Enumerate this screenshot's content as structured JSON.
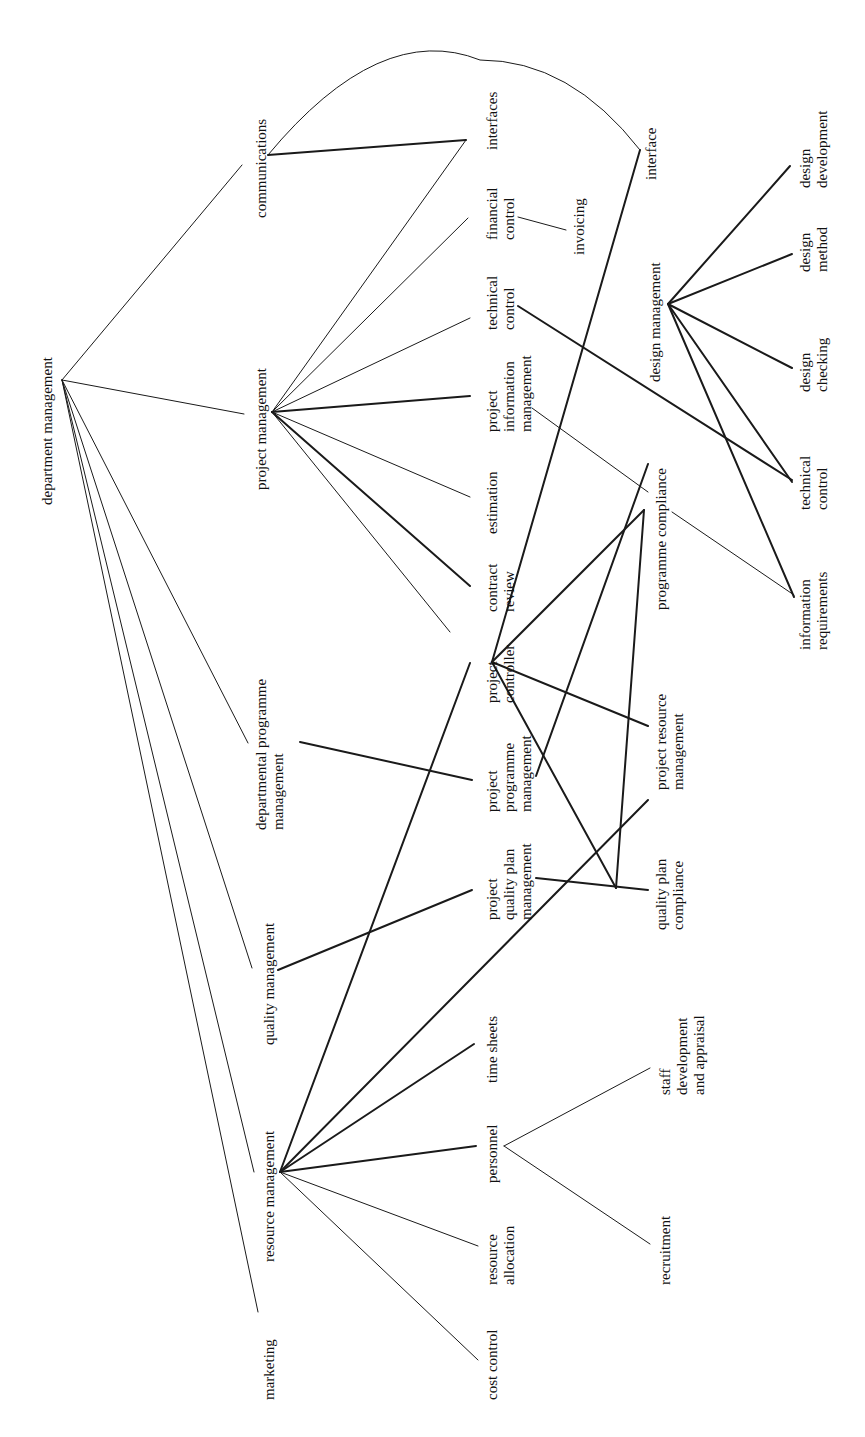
{
  "diagram": {
    "orientation": "rotated-90-ccw",
    "nodes": {
      "department_management": "department management",
      "marketing": "marketing",
      "resource_management": "resource management",
      "quality_management": "quality management",
      "departmental_programme_management": [
        "departmental programme",
        "management"
      ],
      "project_management": "project management",
      "communications": "communications",
      "cost_control": "cost control",
      "resource_allocation": [
        "resource",
        "allocation"
      ],
      "personnel": "personnel",
      "time_sheets": "time sheets",
      "project_quality_plan_management": [
        "project",
        "quality plan",
        "management"
      ],
      "project_programme_management": [
        "project",
        "programme",
        "management"
      ],
      "project_controller": [
        "project",
        "controller"
      ],
      "contract_review": [
        "contract",
        "review"
      ],
      "estimation": "estimation",
      "project_information_management": [
        "project",
        "information",
        "management"
      ],
      "technical_control_pm": [
        "technical",
        "control"
      ],
      "financial_control": [
        "financial",
        "control"
      ],
      "interfaces": "interfaces",
      "recruitment": "recruitment",
      "staff_development_and_appraisal": [
        "staff",
        "development",
        "and appraisal"
      ],
      "quality_plan_compliance": [
        "quality plan",
        "compliance"
      ],
      "project_resource_management": [
        "project resource",
        "management"
      ],
      "programme_compliance": "programme compliance",
      "invoicing": "invoicing",
      "interface": "interface",
      "design_management": "design management",
      "information_requirements": [
        "information",
        "requirements"
      ],
      "technical_control_dm": [
        "technical",
        "control"
      ],
      "design_checking": [
        "design",
        "checking"
      ],
      "design_method": [
        "design",
        "method"
      ],
      "design_development": [
        "design",
        "development"
      ]
    },
    "edges": [
      [
        "department management",
        "marketing"
      ],
      [
        "department management",
        "resource management"
      ],
      [
        "department management",
        "quality management"
      ],
      [
        "department management",
        "departmental programme management"
      ],
      [
        "department management",
        "project management"
      ],
      [
        "department management",
        "communications"
      ],
      [
        "resource management",
        "cost control"
      ],
      [
        "resource management",
        "resource allocation"
      ],
      [
        "resource management",
        "personnel"
      ],
      [
        "resource management",
        "time sheets"
      ],
      [
        "resource management",
        "project resource management"
      ],
      [
        "resource management",
        "project controller"
      ],
      [
        "personnel",
        "recruitment"
      ],
      [
        "personnel",
        "staff development and appraisal"
      ],
      [
        "quality management",
        "project quality plan management"
      ],
      [
        "project quality plan management",
        "quality plan compliance"
      ],
      [
        "departmental programme management",
        "project programme management"
      ],
      [
        "project programme management",
        "design management"
      ],
      [
        "project management",
        "project controller"
      ],
      [
        "project management",
        "contract review"
      ],
      [
        "project management",
        "estimation"
      ],
      [
        "project management",
        "project information management"
      ],
      [
        "project management",
        "technical control"
      ],
      [
        "project management",
        "financial control"
      ],
      [
        "project management",
        "interfaces"
      ],
      [
        "communications",
        "interfaces"
      ],
      [
        "communications",
        "interface"
      ],
      [
        "financial control",
        "invoicing"
      ],
      [
        "project information management",
        "programme compliance"
      ],
      [
        "technical control",
        "technical control (design)"
      ],
      [
        "project controller",
        "interface"
      ],
      [
        "project controller",
        "programme compliance"
      ],
      [
        "project controller",
        "project resource management"
      ],
      [
        "project controller",
        "quality plan compliance"
      ],
      [
        "programme compliance",
        "information requirements"
      ],
      [
        "design management",
        "design development"
      ],
      [
        "design management",
        "design method"
      ],
      [
        "design management",
        "design checking"
      ],
      [
        "design management",
        "technical control (design)"
      ],
      [
        "design management",
        "information requirements"
      ]
    ],
    "caption": "Fig. — Analysis of department management functions and their interfaces"
  }
}
